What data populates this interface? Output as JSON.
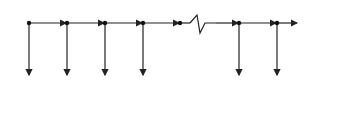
{
  "diagram": {
    "type": "chain",
    "edge_label_horizontal": "a",
    "edge_label_vertical": "d",
    "nodes": [
      {
        "label": "I",
        "x": 29
      },
      {
        "label": "II",
        "x": 67
      },
      {
        "label": "I",
        "x": 105
      },
      {
        "label": "II",
        "x": 143
      },
      {
        "label": "I",
        "x": 239
      },
      {
        "label": "II",
        "x": 277
      }
    ],
    "boxes": [
      {
        "top_right": "-1",
        "bottom_left": "2"
      },
      {
        "top_right": "2",
        "bottom_left": "1"
      },
      {
        "top_right": "1",
        "bottom_left": "4"
      },
      {
        "top_right": "4",
        "bottom_left": "3"
      },
      {
        "top_right": "n-1",
        "bottom_left": "n-2"
      },
      {
        "top_right": "n-2",
        "bottom_left": "n+1"
      }
    ],
    "end_box": {
      "top_right": "n+1",
      "bottom_left": "n"
    },
    "colors": {
      "line": "#222222",
      "background": "#ffffff"
    }
  }
}
